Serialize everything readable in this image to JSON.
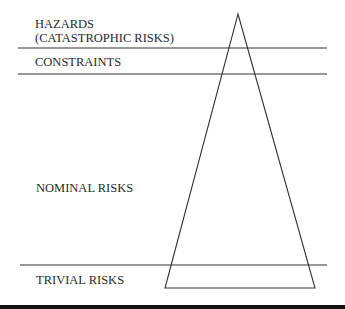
{
  "diagram": {
    "type": "risk-triangle",
    "bands": [
      {
        "id": "hazards",
        "label_line1": "HAZARDS",
        "label_line2": "(CATASTROPHIC RISKS)"
      },
      {
        "id": "constraints",
        "label": "CONSTRAINTS"
      },
      {
        "id": "nominal",
        "label": "NOMINAL RISKS"
      },
      {
        "id": "trivial",
        "label": "TRIVIAL RISKS"
      }
    ],
    "colors": {
      "line": "#333333",
      "text": "#2a2a2a",
      "background": "#ffffff",
      "bottom_rule": "#111111"
    }
  }
}
